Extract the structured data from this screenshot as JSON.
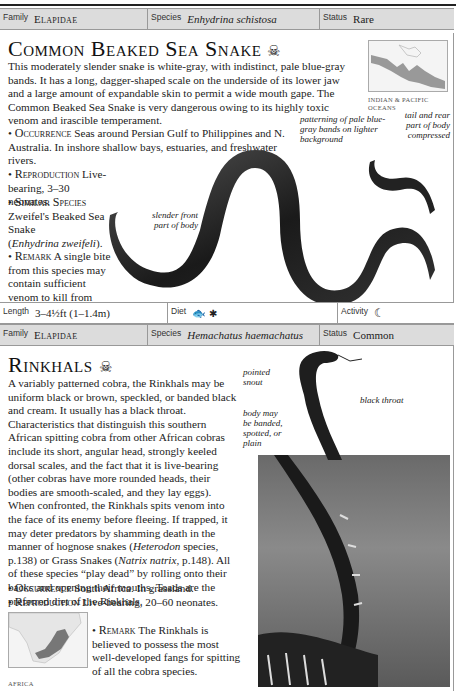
{
  "entry1": {
    "family_label": "Family",
    "family_value": "Elapidae",
    "species_label": "Species",
    "species_value": "Enhydrina schistosa",
    "status_label": "Status",
    "status_value": "Rare",
    "title": "Common Beaked Sea Snake",
    "danger_icon": "skull-crossbones-icon",
    "description": "This moderately slender snake is white-gray, with indistinct, pale blue-gray bands. It has a long, dagger-shaped scale on the underside of its lower jaw and a large amount of expandable skin to permit a wide mouth gape. The Common Beaked Sea Snake is very dangerous owing to its highly toxic venom and irascible temperament.",
    "occurrence_label": "Occurrence",
    "occurrence_text": "Seas around Persian Gulf to Philippines and N. Australia. In inshore shallow bays, estuaries, and freshwater rivers.",
    "reproduction_label": "Reproduction",
    "reproduction_text": "Live-bearing, 3–30 neonates.",
    "similar_label": "Similar Species",
    "similar_text": "Zweifel's Beaked Sea Snake",
    "similar_latin": "Enhydrina zweifeli",
    "remark_label": "Remark",
    "remark_text": "A single bite from this species may contain sufficient venom to kill from five to fifty people.",
    "map_label": "INDIAN & PACIFIC OCEANS",
    "annotations": {
      "patterning": "patterning of pale blue-gray bands on lighter background",
      "tail": "tail and rear part of body compressed",
      "front": "slender front part of body"
    },
    "length_label": "Length",
    "length_value": "3–4½ft (1–1.4m)",
    "diet_label": "Diet",
    "diet_icons": [
      "fish-icon",
      "insect-icon"
    ],
    "activity_label": "Activity",
    "activity_icon": "moon-icon"
  },
  "entry2": {
    "family_label": "Family",
    "family_value": "Elapidae",
    "species_label": "Species",
    "species_value": "Hemachatus haemachatus",
    "status_label": "Status",
    "status_value": "Common",
    "title": "Rinkhals",
    "danger_icon": "skull-crossbones-icon",
    "description_1": "A variably patterned cobra, the Rinkhals may be uniform black or brown, speckled, or banded black and cream. It usually has a black throat. Characteristics that distinguish this southern African spitting cobra from other African cobras include its short, angular head, strongly keeled dorsal scales, and the fact that it is live-bearing (other cobras have more rounded heads, their bodies are smooth-scaled, and they lay eggs). When confronted, the Rinkhals spits venom into the face of its enemy before fleeing. If trapped, it may deter predators by shamming death in the manner of hognose snakes (",
    "heterodon": "Heterodon",
    "description_2": " species, p.138) or Grass Snakes (",
    "natrix": "Natrix natrix",
    "description_3": ", p.148). All of these species “play dead” by rolling onto their backs and opening their mouths. Toads are the preferred diet of the Rinkhals.",
    "occurrence_label": "Occurrence",
    "occurrence_text": "South Africa. In grassland.",
    "reproduction_label": "Reproduction",
    "reproduction_text": "Live-bearing, 20–60 neonates.",
    "remark_label": "Remark",
    "remark_text": "The Rinkhals is believed to possess the most well-developed fangs for spitting of all the cobra species.",
    "map_label": "AFRICA",
    "annotations": {
      "snout": "pointed snout",
      "throat": "black throat",
      "body": "body may be banded, spotted, or plain"
    }
  }
}
